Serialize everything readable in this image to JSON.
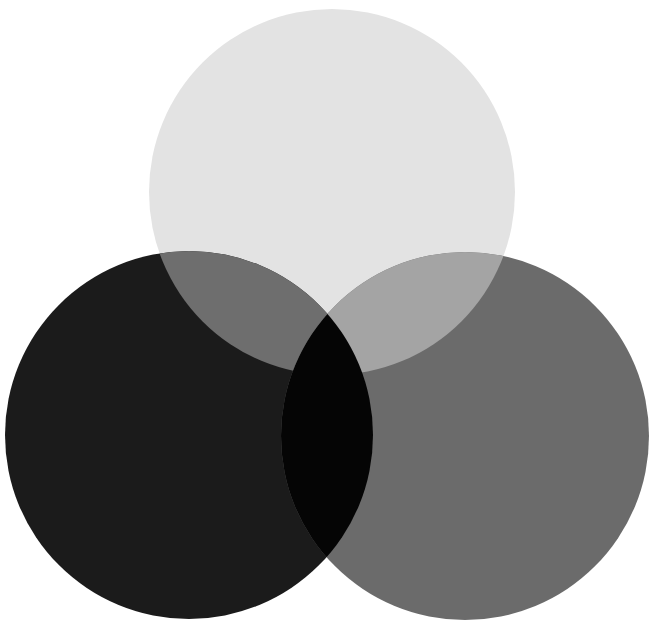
{
  "diagram": {
    "type": "three-circle-venn",
    "background": "#ffffff",
    "circles": [
      {
        "id": "top",
        "cx": 332,
        "cy": 192,
        "r": 183,
        "color": "#e3e3e3"
      },
      {
        "id": "left",
        "cx": 189,
        "cy": 435,
        "r": 184,
        "color": "#1b1b1b"
      },
      {
        "id": "right",
        "cx": 465,
        "cy": 436,
        "r": 184,
        "color": "#6b6b6b"
      }
    ],
    "overlaps": {
      "top_left": "#6e6e6e",
      "top_right": "#a4a4a4",
      "left_right": "#050505",
      "all_three": "#050505"
    }
  }
}
